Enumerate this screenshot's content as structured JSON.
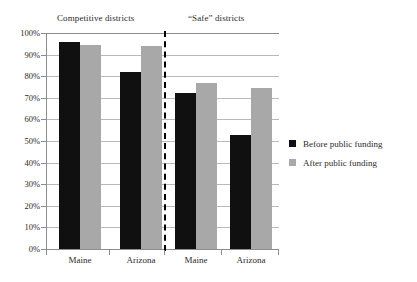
{
  "chart_data": {
    "type": "bar",
    "title": "",
    "xlabel": "",
    "ylabel": "",
    "ylim": [
      0,
      100
    ],
    "grid": true,
    "legend_position": "right",
    "y_ticks": [
      "100%",
      "90%",
      "80%",
      "70%",
      "60%",
      "50%",
      "40%",
      "30%",
      "20%",
      "10%",
      "0%"
    ],
    "y_tick_values": [
      100,
      90,
      80,
      70,
      60,
      50,
      40,
      30,
      20,
      10,
      0
    ],
    "group_headers": [
      "Competitive districts",
      "“Safe” districts"
    ],
    "categories": [
      "Maine",
      "Arizona",
      "Maine",
      "Arizona"
    ],
    "series": [
      {
        "name": "Before public funding",
        "color": "#101010",
        "values": [
          96,
          82,
          72,
          53
        ]
      },
      {
        "name": "After public funding",
        "color": "#a8a8a8",
        "values": [
          94.5,
          94,
          77,
          74.5
        ]
      }
    ],
    "groups": [
      {
        "header": "Competitive districts",
        "categories": [
          "Maine",
          "Arizona"
        ]
      },
      {
        "header": "“Safe” districts",
        "categories": [
          "Maine",
          "Arizona"
        ]
      }
    ],
    "annotations": [
      {
        "type": "divider",
        "style": "dashed-vertical",
        "between": [
          "Competitive districts",
          "“Safe” districts"
        ]
      }
    ]
  },
  "legend": {
    "items": [
      {
        "label": "Before public funding",
        "color": "#101010"
      },
      {
        "label": "After public funding",
        "color": "#a8a8a8"
      }
    ]
  },
  "colors": {
    "before": "#101010",
    "after": "#a8a8a8",
    "grid": "#b9b9b9",
    "axis": "#8d8d8d",
    "text": "#2b2b2b",
    "background": "#ffffff"
  }
}
